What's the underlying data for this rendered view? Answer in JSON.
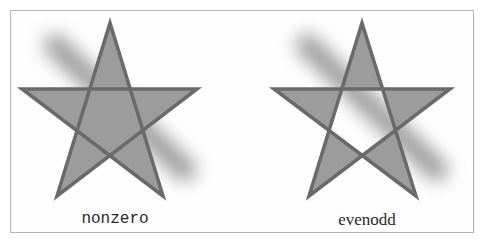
{
  "figure": {
    "colors": {
      "frame_border": "#b4b4b4",
      "star_fill": "#9c9c9c",
      "star_stroke": "#6a6a6a",
      "shadow": "#7a7a7a",
      "label_text": "#2a2a2a"
    },
    "panels": [
      {
        "id": "nonzero",
        "label": "nonzero",
        "fill_rule": "nonzero",
        "star_points": "110,23 163,196 22,89 197,89 57,196"
      },
      {
        "id": "evenodd",
        "label": "evenodd",
        "fill_rule": "evenodd",
        "star_points": "362,23 416,196 274,89 450,89 309,196"
      }
    ]
  }
}
